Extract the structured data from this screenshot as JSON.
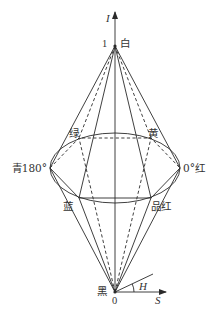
{
  "diagram": {
    "type": "HSI double hexcone color model",
    "axes": {
      "intensity_label": "I",
      "saturation_label": "S",
      "hue_label": "H"
    },
    "top_apex": {
      "value": "1",
      "color_label": "白"
    },
    "bottom_apex": {
      "value": "0",
      "color_label": "黑"
    },
    "hexagon_vertices": {
      "red": "0°红",
      "yellow": "黄",
      "green": "绿",
      "cyan": "青180°",
      "blue": "蓝",
      "magenta": "品红"
    },
    "colors": {
      "line": "#2a2a2a",
      "text": "#333333",
      "background": "#ffffff"
    }
  }
}
